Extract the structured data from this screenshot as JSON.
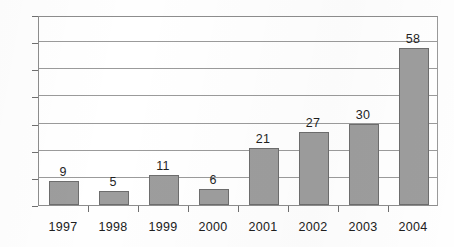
{
  "chart_data": {
    "type": "bar",
    "title": "",
    "subtitle": "",
    "xlabel": "",
    "ylabel": "",
    "categories": [
      "1997",
      "1998",
      "1999",
      "2000",
      "2001",
      "2002",
      "2003",
      "2004"
    ],
    "values": [
      9,
      5,
      11,
      6,
      21,
      27,
      30,
      58
    ],
    "value_labels": [
      "9",
      "5",
      "11",
      "6",
      "21",
      "27",
      "30",
      "58"
    ],
    "ylim": [
      0,
      70
    ],
    "ytick_values": [
      0,
      10,
      20,
      30,
      40,
      50,
      60,
      70
    ],
    "ytick_labels": [
      "0",
      "10",
      "20",
      "30",
      "40",
      "50",
      "60",
      "70"
    ],
    "grid": true,
    "grid_axis": "y",
    "legend": false,
    "legend_position": "none",
    "series": [
      {
        "name": "",
        "values": [
          9,
          5,
          11,
          6,
          21,
          27,
          30,
          58
        ]
      }
    ],
    "colors": {
      "bar_fill": "#9d9d9d",
      "bar_border": "#6d6d6d",
      "gridline": "#9b9b9b",
      "axis": "#8d8d8d",
      "text": "#202020",
      "background": "#ffffff"
    }
  }
}
